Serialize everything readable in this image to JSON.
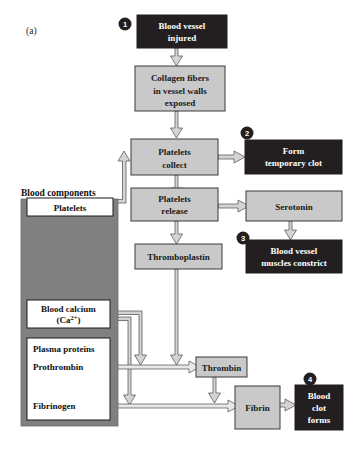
{
  "figure": {
    "panel_label": "(a)",
    "components_title": "Blood components",
    "colors": {
      "dark_box": "#231f20",
      "light_box": "#c9c9c9",
      "white_box": "#ffffff",
      "panel_grey": "#808080",
      "arrow_fill": "#d4d4d4",
      "stroke": "#333333"
    }
  },
  "steps": [
    {
      "id": "step-1",
      "number": "1"
    },
    {
      "id": "step-2",
      "number": "2"
    },
    {
      "id": "step-3",
      "number": "3"
    },
    {
      "id": "step-4",
      "number": "4"
    }
  ],
  "nodes": {
    "blood_vessel_injured": {
      "line1": "Blood vessel",
      "line2": "injured",
      "style": "dark"
    },
    "collagen_fibers": {
      "line1": "Collagen fibers",
      "line2": "in vessel walls",
      "line3": "exposed",
      "style": "light"
    },
    "platelets_collect": {
      "line1": "Platelets",
      "line2": "collect",
      "style": "light"
    },
    "form_temporary_clot": {
      "line1": "Form",
      "line2": "temporary clot",
      "style": "dark"
    },
    "platelets_release": {
      "line1": "Platelets",
      "line2": "release",
      "style": "light"
    },
    "serotonin": {
      "line1": "Serotonin",
      "style": "light"
    },
    "blood_vessel_muscles_constrict": {
      "line1": "Blood vessel",
      "line2": "muscles constrict",
      "style": "dark"
    },
    "thromboplastin": {
      "line1": "Thromboplastin",
      "style": "light"
    },
    "thrombin": {
      "line1": "Thrombin",
      "style": "light"
    },
    "fibrin": {
      "line1": "Fibrin",
      "style": "light"
    },
    "blood_clot_forms": {
      "line1": "Blood",
      "line2": "clot",
      "line3": "forms",
      "style": "dark"
    },
    "platelets_component": {
      "line1": "Platelets",
      "style": "white"
    },
    "blood_calcium": {
      "line1": "Blood calcium",
      "line2_pre": "(Ca",
      "line2_sup": "2+",
      "line2_post": ")",
      "style": "white"
    },
    "plasma_proteins": {
      "title": "Plasma proteins",
      "item1": "Prothrombin",
      "item2": "Fibrinogen",
      "style": "white"
    }
  }
}
